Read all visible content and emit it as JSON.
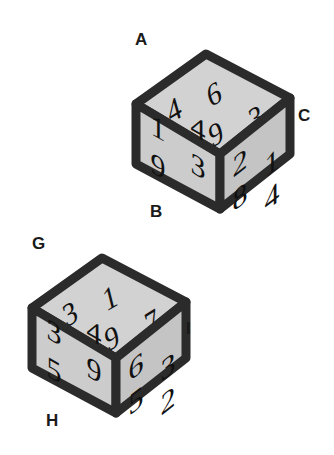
{
  "background_color": "#ffffff",
  "cube_face_color": "#cccccc",
  "cube_face_color_top": "#d2d2d2",
  "cube_face_color_right": "#c4c4c4",
  "cube_edge_color": "#2b2b2b",
  "digit_color": "#111111",
  "label_color": "#1a1a1a",
  "cubes": [
    {
      "id": "cube-1",
      "labels": {
        "top_left": "A",
        "bottom_left": "B",
        "right": "C"
      },
      "faces": {
        "top": {
          "name": "top-face",
          "digits": [
            "4",
            "6",
            "9",
            "3"
          ]
        },
        "left": {
          "name": "left-face",
          "digits": [
            "1",
            "4",
            "9",
            "3"
          ]
        },
        "right": {
          "name": "right-face",
          "digits": [
            "2",
            "1",
            "8",
            "4"
          ]
        }
      }
    },
    {
      "id": "cube-2",
      "labels": {
        "top_left": "G",
        "bottom_left": "H",
        "right": "I"
      },
      "faces": {
        "top": {
          "name": "top-face",
          "digits": [
            "3",
            "1",
            "9",
            "7"
          ]
        },
        "left": {
          "name": "left-face",
          "digits": [
            "3",
            "4",
            "5",
            "9"
          ]
        },
        "right": {
          "name": "right-face",
          "digits": [
            "6",
            "3",
            "5",
            "2"
          ]
        }
      }
    }
  ]
}
